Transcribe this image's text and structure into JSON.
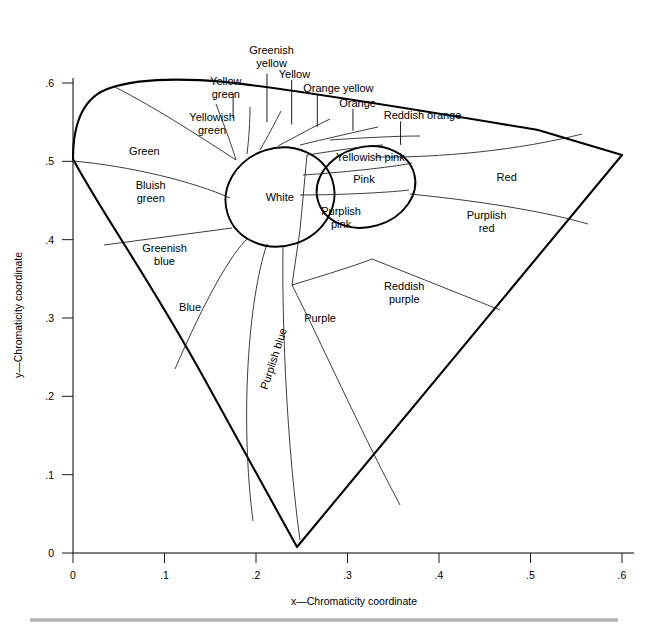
{
  "axes": {
    "x": {
      "label": "x—Chromaticity coordinate",
      "ticks": [
        "0",
        ".1",
        ".2",
        ".3",
        ".4",
        ".5",
        ".6"
      ],
      "tick_values": [
        0,
        0.1,
        0.2,
        0.3,
        0.4,
        0.5,
        0.6
      ],
      "min": 0,
      "max": 0.6
    },
    "y": {
      "label": "y—Chromaticity coordinate",
      "ticks": [
        "0",
        ".1",
        ".2",
        ".3",
        ".4",
        ".5",
        ".6"
      ],
      "tick_values": [
        0,
        0.1,
        0.2,
        0.3,
        0.4,
        0.5,
        0.6
      ],
      "min": 0,
      "max": 0.6
    }
  },
  "regions": [
    {
      "id": "white",
      "label": "White",
      "lines": [
        "White"
      ],
      "x": 0.226,
      "y": 0.455
    },
    {
      "id": "green",
      "label": "Green",
      "lines": [
        "Green"
      ],
      "x": 0.078,
      "y": 0.513
    },
    {
      "id": "yellowish-green",
      "label": "Yellowish green",
      "lines": [
        "Yellowish",
        "green"
      ],
      "x": 0.152,
      "y": 0.548
    },
    {
      "id": "bluish-green",
      "label": "Bluish green",
      "lines": [
        "Bluish",
        "green"
      ],
      "x": 0.085,
      "y": 0.462
    },
    {
      "id": "greenish-blue",
      "label": "Greenish blue",
      "lines": [
        "Greenish",
        "blue"
      ],
      "x": 0.1,
      "y": 0.381
    },
    {
      "id": "blue",
      "label": "Blue",
      "lines": [
        "Blue"
      ],
      "x": 0.128,
      "y": 0.314
    },
    {
      "id": "purplish-blue",
      "label": "Purplish blue",
      "lines": [
        "Purplish blue"
      ],
      "x": 0.219,
      "y": 0.248,
      "rotated": true
    },
    {
      "id": "purple",
      "label": "Purple",
      "lines": [
        "Purple"
      ],
      "x": 0.27,
      "y": 0.3
    },
    {
      "id": "reddish-purple",
      "label": "Reddish purple",
      "lines": [
        "Reddish",
        "purple"
      ],
      "x": 0.362,
      "y": 0.333
    },
    {
      "id": "purplish-pink",
      "label": "Purplish pink",
      "lines": [
        "Purplish",
        "pink"
      ],
      "x": 0.293,
      "y": 0.428
    },
    {
      "id": "pink",
      "label": "Pink",
      "lines": [
        "Pink"
      ],
      "x": 0.318,
      "y": 0.478
    },
    {
      "id": "yellowish-pink",
      "label": "Yellowish pink",
      "lines": [
        "Yellowish pink"
      ],
      "x": 0.325,
      "y": 0.505
    },
    {
      "id": "red",
      "label": "Red",
      "lines": [
        "Red"
      ],
      "x": 0.474,
      "y": 0.48
    },
    {
      "id": "purplish-red",
      "label": "Purplish red",
      "lines": [
        "Purplish",
        "red"
      ],
      "x": 0.452,
      "y": 0.423
    }
  ],
  "callouts": [
    {
      "id": "yellow-green",
      "label": "Yellow green",
      "lines": [
        "Yellow",
        "green"
      ],
      "text_x": 0.167,
      "text_y": 0.594,
      "line_x": 0.175,
      "line_top": 0.586,
      "line_bottom": 0.555
    },
    {
      "id": "greenish-yellow",
      "label": "Greenish yellow",
      "lines": [
        "Greenish",
        "yellow"
      ],
      "text_x": 0.217,
      "text_y": 0.634,
      "line_x": 0.212,
      "line_top": 0.612,
      "line_bottom": 0.55
    },
    {
      "id": "yellow",
      "label": "Yellow",
      "lines": [
        "Yellow"
      ],
      "text_x": 0.242,
      "text_y": 0.612,
      "line_x": 0.239,
      "line_top": 0.604,
      "line_bottom": 0.547
    },
    {
      "id": "orange-yellow",
      "label": "Orange yellow",
      "lines": [
        "Orange yellow"
      ],
      "text_x": 0.29,
      "text_y": 0.594,
      "line_x": 0.267,
      "line_top": 0.586,
      "line_bottom": 0.544
    },
    {
      "id": "orange",
      "label": "Orange",
      "lines": [
        "Orange"
      ],
      "text_x": 0.311,
      "text_y": 0.575,
      "line_x": 0.306,
      "line_top": 0.567,
      "line_bottom": 0.539
    },
    {
      "id": "reddish-orange",
      "label": "Reddish orange",
      "lines": [
        "Reddish orange"
      ],
      "text_x": 0.382,
      "text_y": 0.559,
      "line_x": 0.358,
      "line_top": 0.551,
      "line_bottom": 0.521
    }
  ],
  "colors": {
    "outline": "#000000",
    "divider": "#1a1a1a",
    "background": "#ffffff",
    "base_rule": "#b4b4b4"
  },
  "chart_data": {
    "type": "line",
    "title": "",
    "xlabel": "x—Chromaticity coordinate",
    "ylabel": "y—Chromaticity coordinate",
    "xlim": [
      0,
      0.6
    ],
    "ylim": [
      0,
      0.6
    ],
    "grid": false,
    "legend": "none",
    "xticks": [
      0,
      0.1,
      0.2,
      0.3,
      0.4,
      0.5,
      0.6
    ],
    "yticks": [
      0,
      0.1,
      0.2,
      0.3,
      0.4,
      0.5,
      0.6
    ],
    "xticklabels": [
      "0",
      ".1",
      ".2",
      ".3",
      ".4",
      ".5",
      ".6"
    ],
    "yticklabels": [
      "0",
      ".1",
      ".2",
      ".3",
      ".4",
      ".5",
      ".6"
    ],
    "series": [
      {
        "name": "spectral-locus",
        "closed": true,
        "points": [
          [
            0.0,
            0.503
          ],
          [
            0.005,
            0.54
          ],
          [
            0.017,
            0.565
          ],
          [
            0.036,
            0.578
          ],
          [
            0.062,
            0.585
          ],
          [
            0.1,
            0.586
          ],
          [
            0.15,
            0.58
          ],
          [
            0.21,
            0.569
          ],
          [
            0.28,
            0.554
          ],
          [
            0.36,
            0.535
          ],
          [
            0.45,
            0.517
          ],
          [
            0.54,
            0.503
          ],
          [
            0.6,
            0.497
          ],
          [
            0.245,
            0.008
          ],
          [
            0.0,
            0.503
          ]
        ]
      },
      {
        "name": "white-ellipse",
        "closed": true,
        "center": [
          0.226,
          0.455
        ],
        "rx": 0.06,
        "ry": 0.063,
        "rotation_deg": -18
      },
      {
        "name": "pink-ellipse",
        "closed": true,
        "center": [
          0.32,
          0.468
        ],
        "rx": 0.055,
        "ry": 0.051,
        "rotation_deg": -16
      }
    ]
  }
}
